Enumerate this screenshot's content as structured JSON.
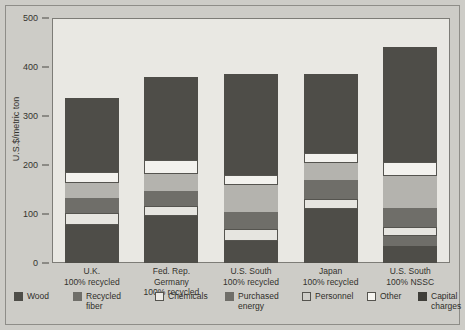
{
  "chart_data": {
    "type": "bar",
    "subtype": "stacked-bar",
    "title": "",
    "xlabel": "",
    "ylabel": "U.S.$/metric ton",
    "ylim": [
      0,
      500
    ],
    "yticks": [
      0,
      100,
      200,
      300,
      400,
      500
    ],
    "ytick_labels": [
      "0",
      "100",
      "200",
      "300",
      "400",
      "500"
    ],
    "grid": false,
    "legend_position": "bottom",
    "categories": [
      "U.K.\n100% recycled",
      "Fed. Rep.\nGermany\n100% recycled",
      "U.S. South\n100% recycled",
      "Japan\n100% recycled",
      "U.S. South\n100% NSSC"
    ],
    "category_lines": [
      [
        "U.K.",
        "100% recycled",
        ""
      ],
      [
        "Fed. Rep.",
        "Germany",
        "100% recycled"
      ],
      [
        "U.S. South",
        "100% recycled",
        ""
      ],
      [
        "Japan",
        "100% recycled",
        ""
      ],
      [
        "U.S. South",
        "100% NSSC",
        ""
      ]
    ],
    "series": [
      {
        "name": "Wood",
        "key": "wood",
        "color": "#4e4d48",
        "values": [
          78,
          95,
          45,
          110,
          35
        ]
      },
      {
        "name": "Recycled fiber",
        "key": "recfiber",
        "color": "#6f6e69",
        "values": [
          0,
          0,
          0,
          0,
          20
        ]
      },
      {
        "name": "Chemicals",
        "key": "chemicals",
        "color": "#e6e5e0",
        "values": [
          25,
          22,
          25,
          20,
          18
        ]
      },
      {
        "name": "Purchased energy",
        "key": "purchased",
        "color": "#6f6e69",
        "values": [
          30,
          30,
          35,
          40,
          40
        ]
      },
      {
        "name": "Personnel",
        "key": "personnel",
        "color": "#b4b3ae",
        "values": [
          30,
          35,
          55,
          35,
          65
        ]
      },
      {
        "name": "Other",
        "key": "other",
        "color": "#f3f2ee",
        "values": [
          22,
          28,
          20,
          20,
          28
        ]
      },
      {
        "name": "Capital charges",
        "key": "capital",
        "color": "#4e4d48",
        "values": [
          152,
          170,
          205,
          160,
          235
        ]
      }
    ],
    "totals": [
      337,
      380,
      385,
      385,
      441
    ],
    "legend": [
      {
        "label": "Wood",
        "key": "wood"
      },
      {
        "label": "Recycled\nfiber",
        "key": "recfiber"
      },
      {
        "label": "Chemicals",
        "key": "chemicals"
      },
      {
        "label": "Purchased\nenergy",
        "key": "purchased"
      },
      {
        "label": "Personnel",
        "key": "personnel"
      },
      {
        "label": "Other",
        "key": "other"
      },
      {
        "label": "Capital\ncharges",
        "key": "capital"
      }
    ]
  }
}
